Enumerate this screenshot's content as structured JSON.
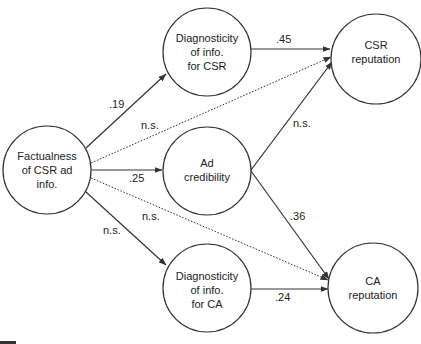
{
  "nodes": {
    "factualness": {
      "lines": [
        "Factualness",
        "of CSR ad",
        "info."
      ]
    },
    "diag_csr": {
      "lines": [
        "Diagnosticity",
        "of info.",
        "for CSR"
      ]
    },
    "ad_cred": {
      "lines": [
        "Ad",
        "credibility"
      ]
    },
    "diag_ca": {
      "lines": [
        "Diagnosticity",
        "of info.",
        "for CA"
      ]
    },
    "csr_rep": {
      "lines": [
        "CSR",
        "reputation"
      ]
    },
    "ca_rep": {
      "lines": [
        "CA",
        "reputation"
      ]
    }
  },
  "edges": {
    "fact_to_diagcsr": {
      "label": ".19",
      "style": "solid"
    },
    "fact_to_csrrep": {
      "label": "n.s.",
      "style": "dotted"
    },
    "fact_to_adcred": {
      "label": ".25",
      "style": "solid"
    },
    "fact_to_carep": {
      "label": "n.s.",
      "style": "dotted"
    },
    "fact_to_diagca": {
      "label": "n.s.",
      "style": "solid"
    },
    "diagcsr_to_csrrep": {
      "label": ".45",
      "style": "solid"
    },
    "adcred_to_csrrep": {
      "label": "n.s.",
      "style": "solid"
    },
    "adcred_to_carep": {
      "label": ".36",
      "style": "solid"
    },
    "diagca_to_carep": {
      "label": ".24",
      "style": "solid"
    }
  }
}
